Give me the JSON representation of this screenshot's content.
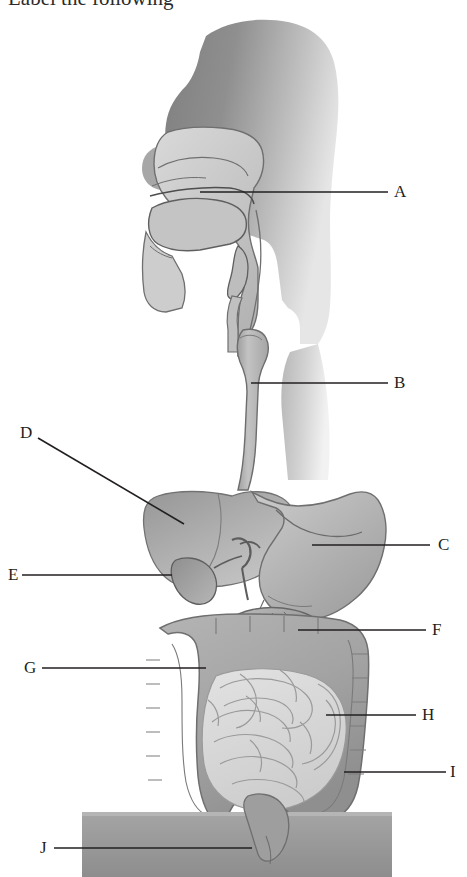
{
  "figure": {
    "title_partial": "Label the following",
    "alt": "Diagram of the human digestive system with lettered leader lines",
    "background": "#ffffff",
    "ink_color": "#231f20",
    "palette": {
      "head_dark": "#8d8d8d",
      "head_light": "#cfcfcf",
      "airway_fill": "#c8c8c8",
      "esophagus_fill": "#b5b5b5",
      "liver_fill": "#a8a8a8",
      "stomach_fill": "#b9b9b9",
      "gallbladder_fill": "#a0a0a0",
      "pancreas_fill": "#a5a5a5",
      "duodenum_fill": "#9a9a9a",
      "large_intestine_fill": "#a6a6a6",
      "small_intestine_fill": "#d6d6d6",
      "torso_fill": "#9b9b9b",
      "outline": "#6f6f6f"
    }
  },
  "labels": [
    {
      "id": "A",
      "text": "A",
      "x": 394,
      "y": 183,
      "structure": "oral-cavity-tongue",
      "leader": {
        "type": "line",
        "x1": 200,
        "y1": 192,
        "x2": 388,
        "y2": 192
      }
    },
    {
      "id": "B",
      "text": "B",
      "x": 394,
      "y": 374,
      "structure": "esophagus",
      "leader": {
        "type": "line",
        "x1": 251,
        "y1": 383,
        "x2": 388,
        "y2": 383
      }
    },
    {
      "id": "C",
      "text": "C",
      "x": 438,
      "y": 536,
      "structure": "stomach",
      "leader": {
        "type": "line",
        "x1": 312,
        "y1": 545,
        "x2": 430,
        "y2": 545
      }
    },
    {
      "id": "D",
      "text": "D",
      "x": 20,
      "y": 424,
      "structure": "liver",
      "leader": {
        "type": "line",
        "x1": 38,
        "y1": 438,
        "x2": 184,
        "y2": 524
      }
    },
    {
      "id": "E",
      "text": "E",
      "x": 8,
      "y": 566,
      "structure": "gallbladder",
      "leader": {
        "type": "line",
        "x1": 22,
        "y1": 575,
        "x2": 172,
        "y2": 575
      }
    },
    {
      "id": "F",
      "text": "F",
      "x": 432,
      "y": 621,
      "structure": "pancreas",
      "leader": {
        "type": "line",
        "x1": 298,
        "y1": 630,
        "x2": 426,
        "y2": 630
      }
    },
    {
      "id": "G",
      "text": "G",
      "x": 24,
      "y": 659,
      "structure": "duodenum",
      "leader": {
        "type": "line",
        "x1": 42,
        "y1": 668,
        "x2": 206,
        "y2": 668
      }
    },
    {
      "id": "H",
      "text": "H",
      "x": 422,
      "y": 706,
      "structure": "small-intestine",
      "leader": {
        "type": "line",
        "x1": 326,
        "y1": 715,
        "x2": 416,
        "y2": 715
      }
    },
    {
      "id": "I",
      "text": "I",
      "x": 450,
      "y": 763,
      "structure": "large-intestine",
      "leader": {
        "type": "line",
        "x1": 344,
        "y1": 772,
        "x2": 446,
        "y2": 772
      }
    },
    {
      "id": "J",
      "text": "J",
      "x": 40,
      "y": 839,
      "structure": "rectum-anus",
      "leader": {
        "type": "line",
        "x1": 54,
        "y1": 848,
        "x2": 252,
        "y2": 848
      }
    }
  ]
}
